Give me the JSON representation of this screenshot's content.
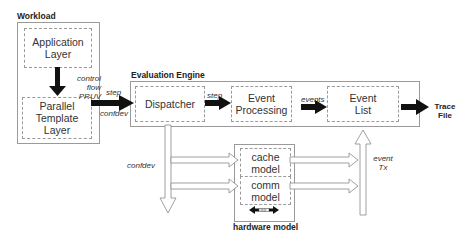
{
  "workload": {
    "title": "Workload",
    "application_layer": "Application Layer",
    "parallel_template_layer": "Parallel Template Layer",
    "arrow_label_line1": "control flow",
    "arrow_label_line2": "PRUV"
  },
  "evaluation_engine": {
    "title": "Evaluation Engine",
    "dispatcher": "Dispatcher",
    "event_processing": "Event Processing",
    "event_list": "Event List",
    "input_label_top": "step",
    "input_label_bottom": "confdev",
    "dispatcher_to_processing_label": "step",
    "processing_to_list_label": "events"
  },
  "output": {
    "label_line1": "Trace",
    "label_line2": "File"
  },
  "hardware_model": {
    "title": "hardware model",
    "cache_model": "cache model",
    "comm_model": "comm model",
    "interconnect_icon": "double-arrow-with-link"
  },
  "flows": {
    "confdev_label": "confdev",
    "event_tx_line1": "event",
    "event_tx_line2": "Tx"
  }
}
